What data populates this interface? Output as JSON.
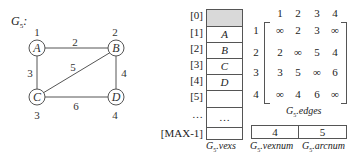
{
  "graph": {
    "title": "G",
    "title_sub": "5",
    "title_suffix": ":",
    "nodes": [
      {
        "name": "A",
        "index": "1"
      },
      {
        "name": "B",
        "index": "2"
      },
      {
        "name": "C",
        "index": "3"
      },
      {
        "name": "D",
        "index": "4"
      }
    ],
    "edges": [
      {
        "from": "A",
        "to": "B",
        "weight": "2"
      },
      {
        "from": "A",
        "to": "C",
        "weight": "3"
      },
      {
        "from": "B",
        "to": "C",
        "weight": "5"
      },
      {
        "from": "B",
        "to": "D",
        "weight": "4"
      },
      {
        "from": "C",
        "to": "D",
        "weight": "6"
      }
    ]
  },
  "vexs": {
    "indices": [
      "[0]",
      "[1]",
      "[2]",
      "[3]",
      "[4]",
      "[5]",
      "…",
      "[MAX-1]"
    ],
    "values": [
      "",
      "A",
      "B",
      "C",
      "D",
      "",
      "…",
      ""
    ],
    "caption_main": "G",
    "caption_sub": "5",
    "caption_field": ".vexs",
    "shaded_color": "#d9d9d9"
  },
  "edges_matrix": {
    "col_headers": [
      "1",
      "2",
      "3",
      "4"
    ],
    "row_headers": [
      "1",
      "2",
      "3",
      "4"
    ],
    "rows": [
      [
        "∞",
        "2",
        "3",
        "∞"
      ],
      [
        "2",
        "∞",
        "5",
        "4"
      ],
      [
        "3",
        "5",
        "∞",
        "6"
      ],
      [
        "∞",
        "4",
        "6",
        "∞"
      ]
    ],
    "caption_main": "G",
    "caption_sub": "5",
    "caption_field": ".edges"
  },
  "counts": {
    "vexnum": "4",
    "arcnum": "5",
    "vexnum_caption_main": "G",
    "vexnum_caption_sub": "5",
    "vexnum_caption_field": ".vexnum",
    "arcnum_caption_main": "G",
    "arcnum_caption_sub": "5",
    "arcnum_caption_field": ".arcnum"
  }
}
